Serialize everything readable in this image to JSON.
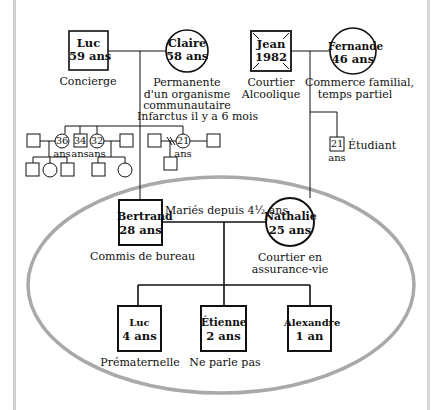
{
  "genogram": {
    "grandparents_paternal": {
      "father": {
        "name": "Luc",
        "age": "59 ans",
        "note": "Concierge"
      },
      "mother": {
        "name": "Claire",
        "age": "58 ans",
        "note_lines": [
          "Permanente",
          "d'un organisme",
          "communautaire",
          "Infarctus il y a 6 mois"
        ]
      }
    },
    "grandparents_maternal": {
      "father": {
        "name": "Jean",
        "age": "1982",
        "note_lines": [
          "Courtier",
          "Alcoolique"
        ],
        "deceased": true
      },
      "mother": {
        "name": "Fernande",
        "age": "46 ans",
        "note_lines": [
          "Commerce familial,",
          "temps partiel"
        ]
      }
    },
    "paternal_siblings": [
      {
        "label": "36",
        "unit": "ans",
        "shape": "circle"
      },
      {
        "label": "34",
        "unit": "ans",
        "shape": "square"
      },
      {
        "label": "32",
        "unit": "ans",
        "shape": "circle"
      },
      {
        "label": "21",
        "unit": "ans",
        "shape": "circle"
      }
    ],
    "maternal_sibling": {
      "label": "21",
      "unit": "ans",
      "shape": "square",
      "note": "Étudiant"
    },
    "couple": {
      "husband": {
        "name": "Bertrand",
        "age": "28 ans",
        "note": "Commis de bureau"
      },
      "wife": {
        "name": "Nathalie",
        "age": "25 ans",
        "note_lines": [
          "Courtier en",
          "assurance-vie"
        ]
      },
      "marriage_label": "Mariés depuis 4½ ans"
    },
    "children": [
      {
        "name": "Luc",
        "age": "4 ans",
        "note": "Prématernelle"
      },
      {
        "name": "Étienne",
        "age": "2 ans",
        "note": "Ne parle pas"
      },
      {
        "name": "Alexandre",
        "age": "1 an",
        "note": ""
      }
    ],
    "colors": {
      "line": "#111111",
      "ellipse": "#a9a9a9",
      "frame": "#cfcfcf"
    }
  }
}
